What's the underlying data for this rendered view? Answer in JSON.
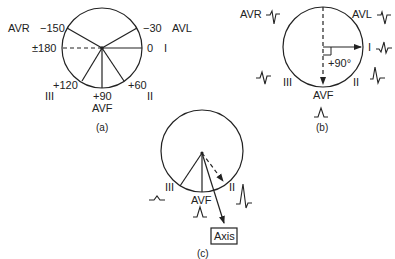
{
  "panels": {
    "a": {
      "caption": "(a)",
      "labels": {
        "avr": "AVR",
        "minus150": "−150",
        "minus30": "−30",
        "avl": "AVL",
        "pm180": "±180",
        "zero": "0",
        "lead_i": "I",
        "plus120": "+120",
        "plus60": "+60",
        "lead_iii": "III",
        "plus90": "+90",
        "lead_ii": "II",
        "avf": "AVF"
      }
    },
    "b": {
      "caption": "(b)",
      "labels": {
        "avr": "AVR",
        "avl": "AVL",
        "lead_i": "I",
        "angle": "+90°",
        "lead_iii": "III",
        "lead_ii": "II",
        "avf": "AVF"
      }
    },
    "c": {
      "caption": "(c)",
      "labels": {
        "lead_iii": "III",
        "avf": "AVF",
        "lead_ii": "II",
        "axis": "Axis"
      }
    }
  },
  "colors": {
    "stroke": "#222222",
    "background": "#ffffff"
  }
}
